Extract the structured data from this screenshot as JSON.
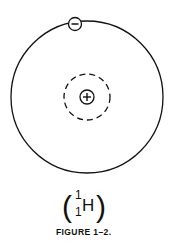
{
  "figure": {
    "caption": "FIGURE 1–2.",
    "isotope": {
      "open_paren": "(",
      "close_paren": ")",
      "mass_number": "1",
      "atomic_number": "1",
      "symbol": "H"
    },
    "electron": {
      "sign": "−",
      "label": "electron"
    },
    "nucleus": {
      "sign": "+",
      "label": "proton"
    },
    "colors": {
      "stroke": "#111111",
      "background": "#ffffff"
    }
  }
}
